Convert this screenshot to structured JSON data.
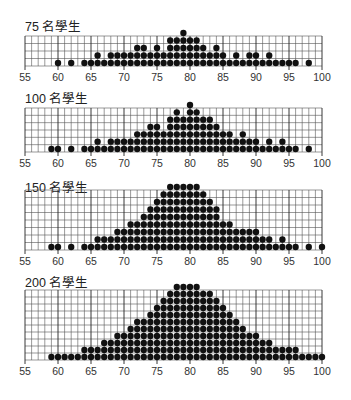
{
  "chart_data": [
    {
      "type": "scatter",
      "subtype": "dot_plot",
      "title": "75 名學生",
      "xlim": [
        55,
        100
      ],
      "xticks": [
        55,
        60,
        65,
        70,
        75,
        80,
        85,
        90,
        95,
        100
      ],
      "grid": true,
      "rows": 4,
      "counts": {
        "60": 1,
        "62": 1,
        "64": 1,
        "65": 1,
        "66": 2,
        "67": 1,
        "68": 2,
        "69": 2,
        "70": 2,
        "71": 2,
        "72": 3,
        "73": 3,
        "74": 2,
        "75": 3,
        "76": 2,
        "77": 4,
        "78": 4,
        "79": 5,
        "80": 4,
        "81": 4,
        "82": 3,
        "83": 2,
        "84": 3,
        "85": 2,
        "86": 1,
        "87": 2,
        "88": 1,
        "89": 2,
        "90": 2,
        "91": 1,
        "92": 2,
        "93": 1,
        "94": 1,
        "95": 1,
        "96": 1,
        "98": 1
      }
    },
    {
      "type": "scatter",
      "subtype": "dot_plot",
      "title": "100 名學生",
      "xlim": [
        55,
        100
      ],
      "xticks": [
        55,
        60,
        65,
        70,
        75,
        80,
        85,
        90,
        95,
        100
      ],
      "grid": true,
      "rows": 6,
      "counts": {
        "59": 1,
        "60": 1,
        "62": 1,
        "64": 1,
        "65": 1,
        "66": 2,
        "67": 1,
        "68": 2,
        "69": 2,
        "70": 2,
        "71": 2,
        "72": 3,
        "73": 3,
        "74": 4,
        "75": 4,
        "76": 3,
        "77": 5,
        "78": 6,
        "79": 5,
        "80": 7,
        "81": 6,
        "82": 5,
        "83": 5,
        "84": 4,
        "85": 3,
        "86": 3,
        "87": 2,
        "88": 3,
        "89": 2,
        "90": 2,
        "91": 1,
        "92": 2,
        "93": 1,
        "94": 2,
        "95": 1,
        "96": 1,
        "98": 1
      }
    },
    {
      "type": "scatter",
      "subtype": "dot_plot",
      "title": "150 名學生",
      "xlim": [
        55,
        100
      ],
      "xticks": [
        55,
        60,
        65,
        70,
        75,
        80,
        85,
        90,
        95,
        100
      ],
      "grid": true,
      "rows": 8,
      "counts": {
        "59": 1,
        "60": 1,
        "62": 1,
        "64": 1,
        "65": 1,
        "66": 2,
        "67": 2,
        "68": 2,
        "69": 3,
        "70": 3,
        "71": 4,
        "72": 4,
        "73": 5,
        "74": 6,
        "75": 7,
        "76": 8,
        "77": 9,
        "78": 9,
        "79": 9,
        "80": 9,
        "81": 9,
        "82": 8,
        "83": 7,
        "84": 6,
        "85": 4,
        "86": 4,
        "87": 3,
        "88": 3,
        "89": 3,
        "90": 3,
        "91": 2,
        "92": 2,
        "93": 1,
        "94": 2,
        "95": 1,
        "96": 1,
        "98": 1,
        "100": 1
      }
    },
    {
      "type": "scatter",
      "subtype": "dot_plot",
      "title": "200 名學生",
      "xlim": [
        55,
        100
      ],
      "xticks": [
        55,
        60,
        65,
        70,
        75,
        80,
        85,
        90,
        95,
        100
      ],
      "grid": true,
      "rows": 10,
      "counts": {
        "59": 1,
        "60": 1,
        "61": 1,
        "62": 1,
        "63": 1,
        "64": 2,
        "65": 2,
        "66": 2,
        "67": 3,
        "68": 3,
        "69": 4,
        "70": 4,
        "71": 5,
        "72": 6,
        "73": 6,
        "74": 7,
        "75": 8,
        "76": 9,
        "77": 10,
        "78": 11,
        "79": 11,
        "80": 11,
        "81": 11,
        "82": 10,
        "83": 10,
        "84": 9,
        "85": 8,
        "86": 7,
        "87": 6,
        "88": 5,
        "89": 4,
        "90": 4,
        "91": 3,
        "92": 3,
        "93": 2,
        "94": 2,
        "95": 2,
        "96": 2,
        "97": 1,
        "98": 1,
        "99": 1,
        "100": 1
      }
    }
  ],
  "panels": [
    {
      "title": "75 名學生"
    },
    {
      "title": "100 名學生"
    },
    {
      "title": "150 名學生"
    },
    {
      "title": "200 名學生"
    }
  ],
  "colors": {
    "dot": "#111111",
    "grid": "#555555",
    "grid_major": "#222222",
    "text": "#222222"
  }
}
